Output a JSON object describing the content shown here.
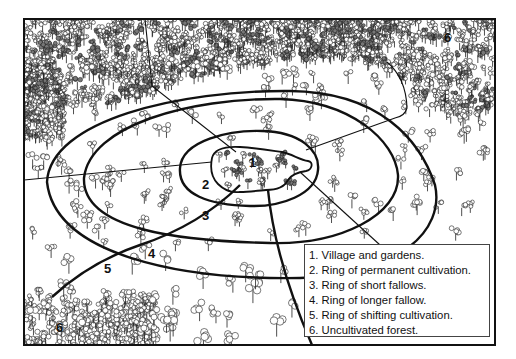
{
  "diagram": {
    "type": "concentric land-use rings (shifting cultivation model)",
    "zone_labels": [
      {
        "id": "1",
        "text": "1"
      },
      {
        "id": "2",
        "text": "2"
      },
      {
        "id": "3",
        "text": "3"
      },
      {
        "id": "4",
        "text": "4"
      },
      {
        "id": "5",
        "text": "5"
      },
      {
        "id": "6a",
        "text": "6"
      },
      {
        "id": "6b",
        "text": "6"
      }
    ],
    "legend": {
      "items": [
        "1. Village and gardens.",
        "2. Ring of permanent cultivation.",
        "3. Ring of short fallows.",
        "4. Ring of longer fallow.",
        "5. Ring of shifting cultivation.",
        "6. Uncultivated forest."
      ]
    },
    "colors": {
      "ink": "#111111",
      "background": "#ffffff",
      "tree_fill": "#ffffff"
    }
  }
}
